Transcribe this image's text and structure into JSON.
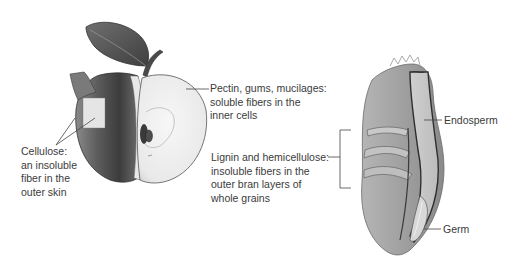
{
  "figure": {
    "apple": {
      "subject": "apple cut open showing skin and inner flesh",
      "labels": {
        "cellulose": {
          "lines": [
            "Cellulose:",
            "an insoluble",
            "fiber in the",
            "outer skin"
          ]
        },
        "pectin": {
          "lines": [
            "Pectin, gums, mucilages:",
            "soluble fibers in the",
            "inner cells"
          ]
        }
      }
    },
    "grain": {
      "subject": "cross-section of a whole grain kernel",
      "labels": {
        "lignin": {
          "lines": [
            "Lignin and hemicellulose:",
            "insoluble fibers in the",
            "outer bran layers of",
            "whole grains"
          ]
        },
        "endosperm": {
          "text": "Endosperm"
        },
        "germ": {
          "text": "Germ"
        }
      }
    },
    "colors": {
      "background": "#ffffff",
      "text": "#3b3b3b",
      "leader_line": "#444444"
    }
  }
}
